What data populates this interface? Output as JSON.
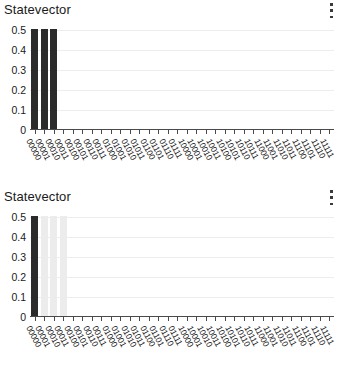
{
  "panels": [
    {
      "title": "Statevector",
      "menu_icon": "kebab-menu-icon"
    },
    {
      "title": "Statevector",
      "menu_icon": "kebab-menu-icon"
    }
  ],
  "footer": {
    "text": ""
  },
  "chart_data": [
    {
      "type": "bar",
      "title": "Statevector",
      "xlabel": "",
      "ylabel": "",
      "ylim": [
        0,
        0.5
      ],
      "yticks": [
        "0",
        "0.1",
        "0.2",
        "0.3",
        "0.4",
        "0.5"
      ],
      "ytick_values": [
        0,
        0.1,
        0.2,
        0.3,
        0.4,
        0.5
      ],
      "grid": true,
      "legend": "none",
      "bar_color": "#2b2b2b",
      "categories": [
        "00000",
        "00001",
        "00010",
        "00011",
        "00100",
        "00101",
        "00110",
        "00111",
        "01000",
        "01001",
        "01010",
        "01011",
        "01100",
        "01101",
        "01110",
        "01111",
        "10000",
        "10001",
        "10010",
        "10011",
        "10100",
        "10101",
        "10110",
        "10111",
        "11000",
        "11001",
        "11010",
        "11011",
        "11100",
        "11101",
        "11110",
        "11111"
      ],
      "values": [
        0.5,
        0.5,
        0.5,
        0.0,
        0,
        0,
        0,
        0,
        0,
        0,
        0,
        0,
        0,
        0,
        0,
        0,
        0,
        0,
        0,
        0,
        0,
        0,
        0,
        0,
        0,
        0,
        0,
        0,
        0,
        0,
        0,
        0
      ],
      "bar_shades": [
        "#2b2b2b",
        "#2b2b2b",
        "#2b2b2b",
        "#e2e2e2",
        "",
        "",
        "",
        "",
        "",
        "",
        "",
        "",
        "",
        "",
        "",
        "",
        "",
        "",
        "",
        "",
        "",
        "",
        "",
        "",
        "",
        "",
        "",
        "",
        "",
        "",
        "",
        ""
      ]
    },
    {
      "type": "bar",
      "title": "Statevector",
      "xlabel": "",
      "ylabel": "",
      "ylim": [
        0,
        0.5
      ],
      "yticks": [
        "0",
        "0.1",
        "0.2",
        "0.3",
        "0.4",
        "0.5"
      ],
      "ytick_values": [
        0,
        0.1,
        0.2,
        0.3,
        0.4,
        0.5
      ],
      "grid": true,
      "legend": "none",
      "bar_color": "#2b2b2b",
      "categories": [
        "00000",
        "00001",
        "00010",
        "00011",
        "00100",
        "00101",
        "00110",
        "00111",
        "01000",
        "01001",
        "01010",
        "01011",
        "01100",
        "01101",
        "01110",
        "01111",
        "10000",
        "10001",
        "10010",
        "10011",
        "10100",
        "10101",
        "10110",
        "10111",
        "11000",
        "11001",
        "11010",
        "11011",
        "11100",
        "11101",
        "11110",
        "11111"
      ],
      "values": [
        0.5,
        0.5,
        0.5,
        0.5,
        0,
        0,
        0,
        0,
        0,
        0,
        0,
        0,
        0,
        0,
        0,
        0,
        0,
        0,
        0,
        0,
        0,
        0,
        0,
        0,
        0,
        0,
        0,
        0,
        0,
        0,
        0,
        0
      ],
      "bar_shades": [
        "#2b2b2b",
        "#ececec",
        "#ececec",
        "#ececec",
        "",
        "",
        "",
        "",
        "",
        "",
        "",
        "",
        "",
        "",
        "",
        "",
        "",
        "",
        "",
        "",
        "",
        "",
        "",
        "",
        "",
        "",
        "",
        "",
        "",
        "",
        "",
        ""
      ]
    }
  ]
}
